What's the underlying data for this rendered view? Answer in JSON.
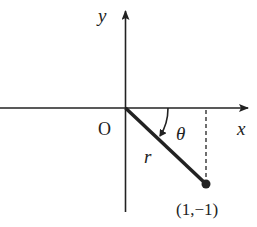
{
  "diagram": {
    "labels": {
      "y_axis": "y",
      "x_axis": "x",
      "origin": "O",
      "radius": "r",
      "angle": "θ",
      "point": "(1,−1)"
    },
    "colors": {
      "stroke": "#222222",
      "background": "#ffffff"
    }
  }
}
